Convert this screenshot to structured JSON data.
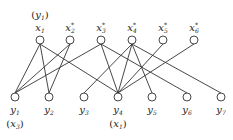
{
  "diagram": {
    "type": "bipartite-graph",
    "top_nodes": [
      {
        "id": "x1",
        "label": "x",
        "sub": "1",
        "sup": "",
        "x": 40,
        "annotation": "(y1)",
        "ann_base": "y",
        "ann_sub": "1"
      },
      {
        "id": "x2",
        "label": "x",
        "sub": "2",
        "sup": "*",
        "x": 70,
        "annotation": ""
      },
      {
        "id": "x3",
        "label": "x",
        "sub": "3",
        "sup": "*",
        "x": 101,
        "annotation": ""
      },
      {
        "id": "x4",
        "label": "x",
        "sub": "4",
        "sup": "*",
        "x": 132,
        "annotation": ""
      },
      {
        "id": "x5",
        "label": "x",
        "sub": "5",
        "sup": "*",
        "x": 163,
        "annotation": ""
      },
      {
        "id": "x6",
        "label": "x",
        "sub": "6",
        "sup": "*",
        "x": 194,
        "annotation": ""
      }
    ],
    "bottom_nodes": [
      {
        "id": "y1",
        "label": "y",
        "sub": "1",
        "x": 15,
        "annotation": "(x3)",
        "ann_base": "x",
        "ann_sub": "3"
      },
      {
        "id": "y2",
        "label": "y",
        "sub": "2",
        "x": 49,
        "annotation": ""
      },
      {
        "id": "y3",
        "label": "y",
        "sub": "3",
        "x": 84,
        "annotation": ""
      },
      {
        "id": "y4",
        "label": "y",
        "sub": "4",
        "x": 118,
        "annotation": "(x1)",
        "ann_base": "x",
        "ann_sub": "1"
      },
      {
        "id": "y5",
        "label": "y",
        "sub": "5",
        "x": 152,
        "annotation": ""
      },
      {
        "id": "y6",
        "label": "y",
        "sub": "6",
        "x": 187,
        "annotation": ""
      },
      {
        "id": "y7",
        "label": "y",
        "sub": "7",
        "x": 221,
        "annotation": ""
      }
    ],
    "edges": [
      [
        "x1",
        "y1"
      ],
      [
        "x1",
        "y2"
      ],
      [
        "x1",
        "y4"
      ],
      [
        "x2",
        "y1"
      ],
      [
        "x2",
        "y2"
      ],
      [
        "x3",
        "y1"
      ],
      [
        "x3",
        "y4"
      ],
      [
        "x3",
        "y6"
      ],
      [
        "x4",
        "y3"
      ],
      [
        "x4",
        "y4"
      ],
      [
        "x4",
        "y5"
      ],
      [
        "x4",
        "y7"
      ],
      [
        "x5",
        "y4"
      ],
      [
        "x6",
        "y4"
      ]
    ],
    "top_y": 40,
    "bottom_y": 97
  }
}
